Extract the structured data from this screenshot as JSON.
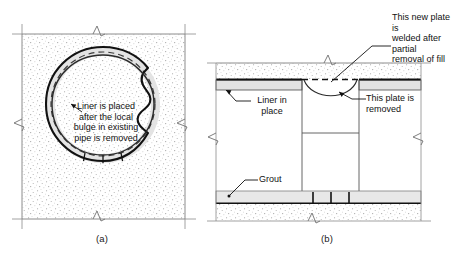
{
  "figure": {
    "panels": [
      {
        "id": "a",
        "caption": "(a)",
        "view": "cross-section of circular pipe in fill",
        "annotations": [
          {
            "name": "liner-note",
            "text": "Liner is placed\nafter the local\nbulge in existing\npipe is removed",
            "leader": "arrow pointing up-left to liner wall"
          }
        ],
        "elements": [
          "stippled-fill-block",
          "outer-pipe-wall-solid",
          "original-pipe-profile-dashed",
          "liner-ring-gray",
          "liner-segment-joints",
          "local-bulge"
        ]
      },
      {
        "id": "b",
        "caption": "(b)",
        "view": "longitudinal elevation section",
        "annotations": [
          {
            "name": "new-plate-note",
            "text": "This new plate is\nwelded after partial\nremoval of fill",
            "leader": "leader to dashed plate line"
          },
          {
            "name": "liner-note",
            "text": "Liner in\nplace",
            "leader": "arrow pointing up-left to liner band"
          },
          {
            "name": "removed-plate-note",
            "text": "This plate is\nremoved",
            "leader": "arrow pointing up-left to sag curve"
          },
          {
            "name": "grout-note",
            "text": "Grout",
            "leader": "leader down-left to dot in grout band"
          }
        ],
        "elements": [
          "upper-stippled-fill",
          "new-plate-dashed",
          "upper-liner-band",
          "vertical-shaft",
          "shaft-divider",
          "grout-band",
          "lower-stippled-fill",
          "sag-curve"
        ]
      }
    ],
    "colors": {
      "line": "#1a1a1a",
      "thin_line": "#7d7d7d",
      "liner_fill": "#e3e3e3",
      "grout_fill": "#e8e8e8",
      "stipple": "#9a9a9a",
      "background": "#ffffff"
    }
  }
}
